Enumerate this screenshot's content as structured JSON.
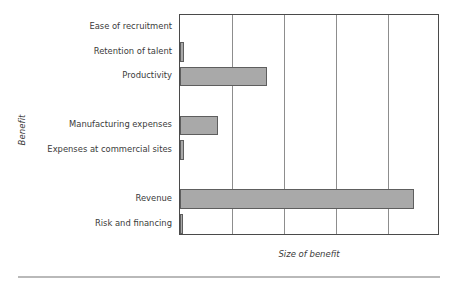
{
  "chart_data": {
    "type": "bar",
    "orientation": "horizontal",
    "title": "",
    "xlabel": "Size of benefit",
    "ylabel": "Benefit",
    "categories": [
      "Ease of recruitment",
      "Retention of talent",
      "Productivity",
      "",
      "Manufacturing expenses",
      "Expenses at commercial sites",
      "",
      "Revenue",
      "Risk and financing"
    ],
    "values": [
      0,
      0.08,
      1.67,
      null,
      0.73,
      0.08,
      null,
      4.5,
      0.06
    ],
    "xlim": [
      0,
      5
    ],
    "ylim": [
      0,
      9
    ],
    "xticks": [
      0,
      1,
      2,
      3,
      4,
      5
    ],
    "xticklabels": [
      "",
      "",
      "",
      "",
      "",
      ""
    ],
    "grid": "vertical",
    "legend": "none",
    "bar_color": "#a9a9a9",
    "bar_edge_color": "#5e5e5e",
    "axis_color": "#4a4a4a",
    "gridline_color": "#8d8d8d",
    "text_color": "#3a3a3a"
  },
  "axis_titles": {
    "x": "Size of benefit",
    "y": "Benefit"
  },
  "categories": [
    {
      "label": "Ease of recruitment",
      "value": 0,
      "slot": 0
    },
    {
      "label": "Retention of talent",
      "value": 0.08,
      "slot": 1
    },
    {
      "label": "Productivity",
      "value": 1.67,
      "slot": 2
    },
    {
      "label": "Manufacturing expenses",
      "value": 0.73,
      "slot": 4
    },
    {
      "label": "Expenses at commercial sites",
      "value": 0.08,
      "slot": 5
    },
    {
      "label": "Revenue",
      "value": 4.5,
      "slot": 7
    },
    {
      "label": "Risk and financing",
      "value": 0.06,
      "slot": 8
    }
  ]
}
